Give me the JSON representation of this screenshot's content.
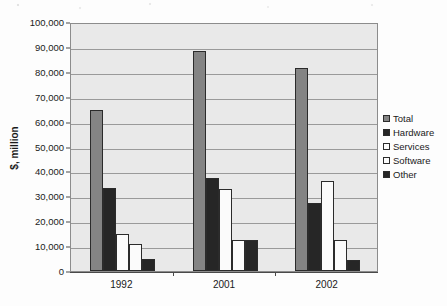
{
  "chart_data": {
    "type": "bar",
    "title": "",
    "subtitle": "",
    "xlabel": "",
    "ylabel": "$, million",
    "categories": [
      "1992",
      "2001",
      "2002"
    ],
    "series": [
      {
        "name": "Total",
        "color": "#848484",
        "values": [
          64500,
          88500,
          81500
        ]
      },
      {
        "name": "Hardware",
        "color": "#262626",
        "values": [
          33500,
          37500,
          27500
        ]
      },
      {
        "name": "Services",
        "color": "#fbfbfb",
        "values": [
          14800,
          33000,
          36000
        ]
      },
      {
        "name": "Software",
        "color": "#fbfbfb",
        "values": [
          11000,
          12300,
          12500
        ]
      },
      {
        "name": "Other",
        "color": "#262626",
        "values": [
          4700,
          12500,
          4300
        ]
      }
    ],
    "ylim": [
      0,
      100000
    ],
    "ytick_step": 10000,
    "ytick_labels": [
      "100,000",
      "90,000",
      "80,000",
      "70,000",
      "60,000",
      "50,000",
      "40,000",
      "30,000",
      "20,000",
      "10,000",
      "0"
    ],
    "ytick_values": [
      100000,
      90000,
      80000,
      70000,
      60000,
      50000,
      40000,
      30000,
      20000,
      10000,
      0
    ],
    "grid": true,
    "grid_axis": "y",
    "legend_position": "right",
    "plot_background": "#e9e9e9",
    "grid_color": "#9a9a9a",
    "axis_color": "#4a4a4a",
    "bar_border_color": "#2b2b2b"
  },
  "legend": {
    "items": [
      {
        "label": "Total",
        "swatch": "total"
      },
      {
        "label": "Hardware",
        "swatch": "hardware"
      },
      {
        "label": "Services",
        "swatch": "services"
      },
      {
        "label": "Software",
        "swatch": "software"
      },
      {
        "label": "Other",
        "swatch": "other"
      }
    ]
  }
}
